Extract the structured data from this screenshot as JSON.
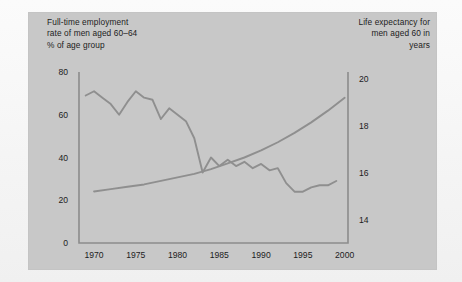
{
  "figure": {
    "background_color": "#f2f2f2",
    "panel_color": "#c8c8c8",
    "line_color": "#8f8f8f",
    "axis_color": "#8c8c8c",
    "text_color": "#1c1c1c"
  },
  "captions": {
    "left": "Full-time employment\nrate of men aged 60–64\n% of age group",
    "right": "Life expectancy for\nmen aged 60 in\nyears"
  },
  "chart_data": {
    "type": "line",
    "title": "",
    "subtitle": "",
    "xlabel": "",
    "ylabel": "% of age group",
    "y2label": "years",
    "grid": false,
    "legend": "none",
    "xlim": [
      1968.2,
      2000.4
    ],
    "ylim": [
      0,
      80
    ],
    "y2lim": [
      13.0,
      20.3
    ],
    "xticks": [
      1970,
      1975,
      1980,
      1985,
      1990,
      1995,
      2000
    ],
    "xticklabels": [
      "1970",
      "1975",
      "1980",
      "1985",
      "1990",
      "1995",
      "2000"
    ],
    "yticks": [
      0,
      20,
      40,
      60,
      80
    ],
    "yticklabels": [
      "0",
      "20",
      "40",
      "60",
      "80"
    ],
    "y2ticks": [
      14,
      16,
      18,
      20
    ],
    "y2ticklabels": [
      "14",
      "16",
      "18",
      "20"
    ],
    "series": [
      {
        "name": "Full-time employment rate of men aged 60–64",
        "axis": "left",
        "units": "% of age group",
        "x": [
          1969,
          1970,
          1971,
          1972,
          1973,
          1974,
          1975,
          1976,
          1977,
          1978,
          1979,
          1980,
          1981,
          1982,
          1983,
          1984,
          1985,
          1986,
          1987,
          1988,
          1989,
          1990,
          1991,
          1992,
          1993,
          1994,
          1995,
          1996,
          1997,
          1998,
          1999
        ],
        "values": [
          69,
          71,
          68,
          65,
          60,
          66,
          71,
          68,
          67,
          58,
          63,
          60,
          57,
          49,
          33,
          40,
          36,
          39,
          36,
          38,
          35,
          37,
          34,
          35,
          28,
          24,
          24,
          26,
          27,
          27,
          29
        ]
      },
      {
        "name": "Life expectancy for men aged 60",
        "axis": "right",
        "units": "years",
        "x": [
          1970,
          1972,
          1974,
          1976,
          1978,
          1980,
          1982,
          1984,
          1986,
          1988,
          1990,
          1992,
          1994,
          1996,
          1998,
          2000
        ],
        "values": [
          15.2,
          15.3,
          15.4,
          15.5,
          15.65,
          15.8,
          15.95,
          16.15,
          16.4,
          16.65,
          16.95,
          17.3,
          17.7,
          18.15,
          18.65,
          19.2
        ]
      }
    ]
  }
}
